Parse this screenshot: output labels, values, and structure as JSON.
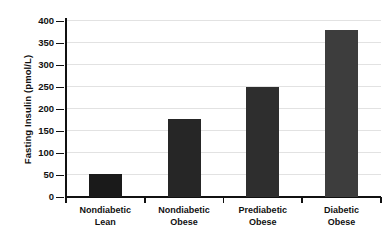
{
  "chart_data": {
    "type": "bar",
    "title": "",
    "xlabel": "",
    "ylabel": "Fasting Insulin (pmol/L)",
    "ylim": [
      0,
      400
    ],
    "yticks": [
      0,
      50,
      100,
      150,
      200,
      250,
      300,
      350,
      400
    ],
    "ytick_labels": [
      "0",
      "50",
      "100",
      "150",
      "200",
      "250",
      "300",
      "350",
      "400"
    ],
    "grid": true,
    "legend": "none",
    "categories": [
      "Nondiabetic Lean",
      "Nondiabetic Obese",
      "Prediabetic Obese",
      "Diabetic Obese"
    ],
    "category_lines": [
      [
        "Nondiabetic",
        "Lean"
      ],
      [
        "Nondiabetic",
        "Obese"
      ],
      [
        "Prediabetic",
        "Obese"
      ],
      [
        "Diabetic",
        "Obese"
      ]
    ],
    "values": [
      52,
      177,
      250,
      380
    ],
    "bar_colors": [
      "#1a1a1a",
      "#262626",
      "#2e2e2e",
      "#3d3d3d"
    ],
    "axis_color": "#111111",
    "grid_color": "#e2e2e2",
    "background_color": "#ffffff"
  }
}
